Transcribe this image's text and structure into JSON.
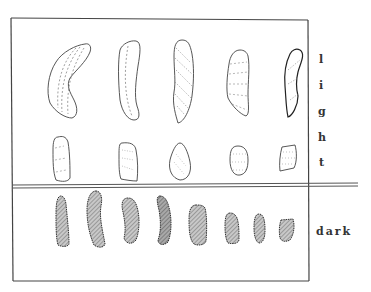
{
  "figure": {
    "frame_color": "#444444",
    "groups": [
      {
        "label": "light",
        "letters": [
          "l",
          "i",
          "g",
          "h",
          "t"
        ],
        "rows": [
          {
            "count": 5,
            "style": "outlined with dashed internal lines",
            "size": "large"
          },
          {
            "count": 5,
            "style": "outlined with dashed/dotted internal lines",
            "size": "small"
          }
        ]
      },
      {
        "label": "dark",
        "rows": [
          {
            "count": 8,
            "style": "hatched/shaded fill",
            "size": "medium"
          }
        ]
      }
    ],
    "colors": {
      "ink": "#333333",
      "dark_fill": "#9a9a9a",
      "background": "#ffffff"
    }
  }
}
